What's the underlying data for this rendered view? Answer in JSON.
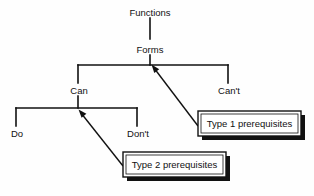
{
  "diagram": {
    "background_color": "#fefefe",
    "line_color": "#111111",
    "text_color": "#111111",
    "nodes": [
      {
        "id": "functions",
        "label": "Functions",
        "x": 150,
        "y": 13
      },
      {
        "id": "forms",
        "label": "Forms",
        "x": 150,
        "y": 50
      },
      {
        "id": "can",
        "label": "Can",
        "x": 79,
        "y": 92
      },
      {
        "id": "cant",
        "label": "Can't",
        "x": 228,
        "y": 92
      },
      {
        "id": "do",
        "label": "Do",
        "x": 17,
        "y": 135
      },
      {
        "id": "dont",
        "label": "Don't",
        "x": 136,
        "y": 135
      }
    ],
    "boxes": [
      {
        "id": "type1",
        "label": "Type 1 prerequisites",
        "x": 198,
        "y": 111,
        "w": 103,
        "h": 25
      },
      {
        "id": "type2",
        "label": "Type 2 prerequisites",
        "x": 123,
        "y": 152,
        "w": 103,
        "h": 25
      }
    ],
    "arrows": [
      {
        "id": "arrow-type1-to-forms",
        "from_box": "type1",
        "to_node": "forms",
        "x1": 198,
        "y1": 126,
        "x2": 153,
        "y2": 67
      },
      {
        "id": "arrow-type2-to-can",
        "from_box": "type2",
        "to_node": "can",
        "x1": 123,
        "y1": 166,
        "x2": 80,
        "y2": 112
      }
    ],
    "edges": [
      {
        "id": "edge-functions-forms",
        "from": "functions",
        "to": "forms"
      },
      {
        "id": "edge-forms-can",
        "from": "forms",
        "to": "can"
      },
      {
        "id": "edge-forms-cant",
        "from": "forms",
        "to": "cant"
      },
      {
        "id": "edge-can-do",
        "from": "can",
        "to": "do"
      },
      {
        "id": "edge-can-dont",
        "from": "can",
        "to": "dont"
      }
    ]
  }
}
